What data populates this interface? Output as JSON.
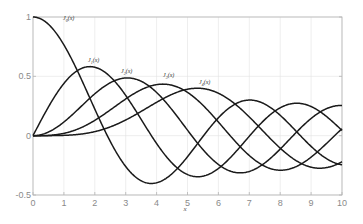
{
  "chart_data": {
    "type": "line",
    "title": "",
    "xlabel": "x",
    "ylabel": "",
    "xlim": [
      0,
      10
    ],
    "ylim": [
      -0.5,
      1
    ],
    "grid": true,
    "legend": "none (inline curve labels)",
    "x_ticks": [
      "0",
      "1",
      "2",
      "3",
      "4",
      "5",
      "6",
      "7",
      "8",
      "9",
      "10"
    ],
    "y_ticks": [
      "-0.5",
      "0",
      "0.5",
      "1"
    ],
    "x": [
      0,
      0.5,
      1,
      1.5,
      2,
      2.5,
      3,
      3.5,
      4,
      4.5,
      5,
      5.5,
      6,
      6.5,
      7,
      7.5,
      8,
      8.5,
      9,
      9.5,
      10
    ],
    "series": [
      {
        "name": "J0(x)",
        "order": 0,
        "label": {
          "text": "J",
          "sub": "0",
          "arg": "(x)",
          "px": 63,
          "py": 20
        },
        "values": [
          1.0,
          0.938,
          0.765,
          0.512,
          0.224,
          -0.048,
          -0.26,
          -0.38,
          -0.397,
          -0.321,
          -0.178,
          -0.007,
          0.151,
          0.26,
          0.3,
          0.266,
          0.172,
          0.042,
          -0.09,
          -0.194,
          -0.246
        ]
      },
      {
        "name": "J1(x)",
        "order": 1,
        "label": {
          "text": "J",
          "sub": "1",
          "arg": "(x)",
          "px": 88,
          "py": 62
        },
        "values": [
          0.0,
          0.242,
          0.44,
          0.558,
          0.577,
          0.497,
          0.339,
          0.137,
          -0.066,
          -0.231,
          -0.328,
          -0.341,
          -0.277,
          -0.154,
          -0.005,
          0.135,
          0.235,
          0.273,
          0.245,
          0.161,
          0.043
        ]
      },
      {
        "name": "J2(x)",
        "order": 2,
        "label": {
          "text": "J",
          "sub": "2",
          "arg": "(x)",
          "px": 121,
          "py": 73
        },
        "values": [
          0.0,
          0.031,
          0.115,
          0.232,
          0.353,
          0.446,
          0.486,
          0.459,
          0.364,
          0.218,
          0.047,
          -0.117,
          -0.243,
          -0.307,
          -0.301,
          -0.23,
          -0.113,
          0.022,
          0.145,
          0.228,
          0.255
        ]
      },
      {
        "name": "J3(x)",
        "order": 3,
        "label": {
          "text": "J",
          "sub": "3",
          "arg": "(x)",
          "px": 163,
          "py": 77
        },
        "values": [
          0.0,
          0.003,
          0.02,
          0.061,
          0.129,
          0.217,
          0.309,
          0.387,
          0.43,
          0.425,
          0.365,
          0.256,
          0.115,
          -0.035,
          -0.168,
          -0.258,
          -0.291,
          -0.263,
          -0.181,
          -0.065,
          0.058
        ]
      },
      {
        "name": "J4(x)",
        "order": 4,
        "label": {
          "text": "J",
          "sub": "4",
          "arg": "(x)",
          "px": 199,
          "py": 84
        },
        "values": [
          0.0,
          0.0,
          0.002,
          0.011,
          0.034,
          0.074,
          0.132,
          0.204,
          0.281,
          0.348,
          0.391,
          0.397,
          0.358,
          0.275,
          0.158,
          0.024,
          -0.105,
          -0.206,
          -0.265,
          -0.269,
          -0.22
        ]
      }
    ]
  },
  "colors": {
    "curve": "#1a1a1a",
    "grid": "#e3e3e3",
    "axis": "#b5b5b5",
    "tick_text": "#8a8a8a"
  }
}
